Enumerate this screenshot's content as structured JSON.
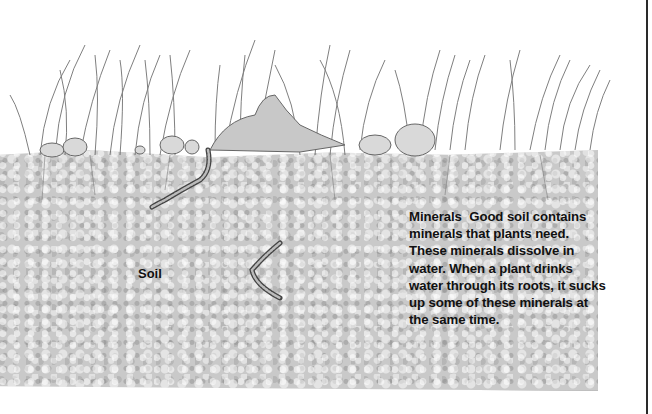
{
  "illustration": {
    "subject": "cross-section of grass, stones, leaf and soil with earthworms",
    "elements": [
      "grass-clumps",
      "stones",
      "leaf",
      "earthworm",
      "earthworm",
      "soil"
    ]
  },
  "labels": {
    "soil": "Soil"
  },
  "caption": {
    "title": "Minerals",
    "body": "Good soil contains minerals that plants need. These minerals dissolve in water. When a plant drinks water through its roots, it sucks up some of these minerals at the same time."
  },
  "colors": {
    "soil": "#c9c9c9",
    "text": "#111111",
    "background": "#ffffff"
  }
}
